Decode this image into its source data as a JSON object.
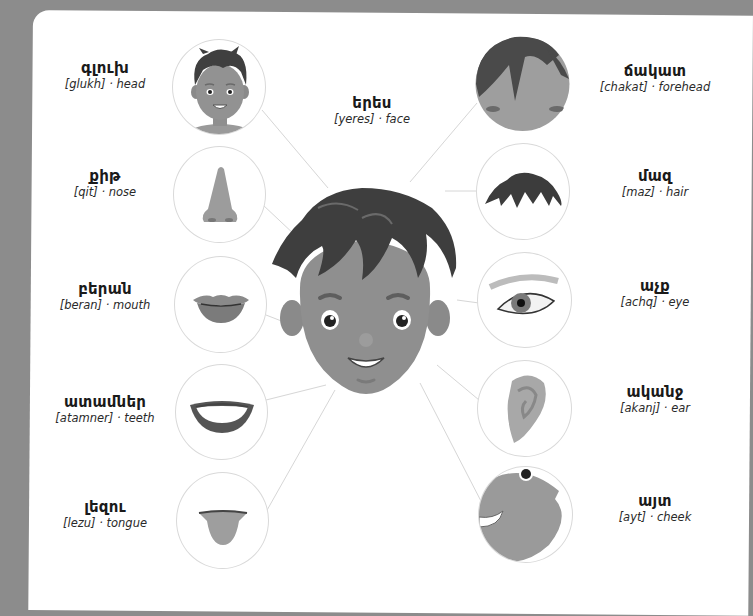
{
  "page": {
    "background": "#8c8c8c",
    "card_background": "#ffffff",
    "line_color": "#d6d6d6",
    "style": "grayscale vocabulary worksheet"
  },
  "center": {
    "label": {
      "armenian": "երես",
      "transliteration": "[yeres]",
      "separator": "·",
      "english": "face"
    },
    "image": "boy-face-illustration"
  },
  "left_items": [
    {
      "armenian": "գլուխ",
      "transliteration": "[glukh]",
      "separator": "·",
      "english": "head",
      "image": "boy-head-icon"
    },
    {
      "armenian": "քիթ",
      "transliteration": "[qit]",
      "separator": "·",
      "english": "nose",
      "image": "nose-icon"
    },
    {
      "armenian": "բերան",
      "transliteration": "[beran]",
      "separator": "·",
      "english": "mouth",
      "image": "lips-icon"
    },
    {
      "armenian": "ատամներ",
      "transliteration": "[atamner]",
      "separator": "·",
      "english": "teeth",
      "image": "smile-teeth-icon"
    },
    {
      "armenian": "լեզու",
      "transliteration": "[lezu]",
      "separator": "·",
      "english": "tongue",
      "image": "tongue-icon"
    }
  ],
  "right_items": [
    {
      "armenian": "ճակատ",
      "transliteration": "[chakat]",
      "separator": "·",
      "english": "forehead",
      "image": "forehead-closeup-icon"
    },
    {
      "armenian": "մազ",
      "transliteration": "[maz]",
      "separator": "·",
      "english": "hair",
      "image": "hair-icon"
    },
    {
      "armenian": "աչք",
      "transliteration": "[achq]",
      "separator": "·",
      "english": "eye",
      "image": "eye-icon"
    },
    {
      "armenian": "ականջ",
      "transliteration": "[akanj]",
      "separator": "·",
      "english": "ear",
      "image": "ear-icon"
    },
    {
      "armenian": "այտ",
      "transliteration": "[ayt]",
      "separator": "·",
      "english": "cheek",
      "image": "cheek-closeup-icon"
    }
  ]
}
